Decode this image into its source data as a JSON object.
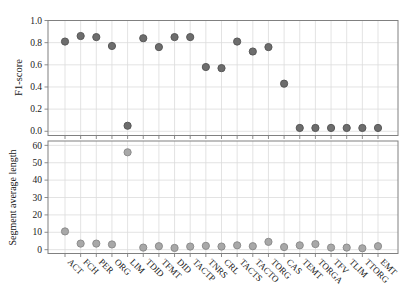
{
  "figure": {
    "top_axis_label": "F1-score",
    "bottom_axis_label": "Segment average length",
    "colors": {
      "top_dot_fill": "#6d6d6d",
      "top_dot_edge": "#585858",
      "bottom_dot_fill": "#a8a8a8",
      "bottom_dot_edge": "#8c8c8c",
      "grid": "#dcdcdc",
      "spine": "#808080",
      "tick_text": "#1a1a1a"
    }
  },
  "chart_data": [
    {
      "type": "scatter",
      "title": "",
      "ylabel": "F1-score",
      "xlabel": "",
      "categories": [
        "ACT",
        "FCH",
        "PER",
        "ORG",
        "LIM",
        "TDID",
        "TFMT",
        "DID",
        "TACTP",
        "TNRS",
        "CRL",
        "TACTS",
        "TACTO",
        "TORG",
        "CAS",
        "TEMT",
        "TORGA",
        "TFV",
        "TLIM",
        "TTORG",
        "EMT"
      ],
      "values": [
        0.81,
        0.86,
        0.85,
        0.77,
        0.05,
        0.84,
        0.76,
        0.85,
        0.85,
        0.58,
        0.57,
        0.81,
        0.72,
        0.76,
        0.43,
        0.03,
        0.03,
        0.03,
        0.03,
        0.03,
        0.03
      ],
      "ylim": [
        0.0,
        1.0
      ],
      "yticks": [
        "1.0",
        "0.8",
        "0.6",
        "0.4",
        "0.2",
        "0.0"
      ],
      "ytick_values": [
        1.0,
        0.8,
        0.6,
        0.4,
        0.2,
        0.0
      ],
      "grid": true,
      "legend": "none",
      "x_tick_labels_shown": false
    },
    {
      "type": "scatter",
      "title": "",
      "ylabel": "Segment average length",
      "xlabel": "",
      "categories": [
        "ACT",
        "FCH",
        "PER",
        "ORG",
        "LIM",
        "TDID",
        "TFMT",
        "DID",
        "TACTP",
        "TNRS",
        "CRL",
        "TACTS",
        "TACTO",
        "TORG",
        "CAS",
        "TEMT",
        "TORGA",
        "TFV",
        "TLIM",
        "TTORG",
        "EMT"
      ],
      "values": [
        10.5,
        3.5,
        3.5,
        3,
        56,
        1.2,
        2,
        1,
        1.8,
        2.2,
        1.8,
        2.5,
        2,
        4.5,
        1.5,
        2.5,
        3.2,
        1.2,
        1.2,
        0.8,
        2
      ],
      "ylim": [
        0,
        60
      ],
      "yticks": [
        "60",
        "50",
        "40",
        "30",
        "20",
        "10",
        "0"
      ],
      "ytick_values": [
        60,
        50,
        40,
        30,
        20,
        10,
        0
      ],
      "grid": true,
      "legend": "none",
      "x_tick_labels_shown": true,
      "x_tick_label_rotation": 45
    }
  ]
}
